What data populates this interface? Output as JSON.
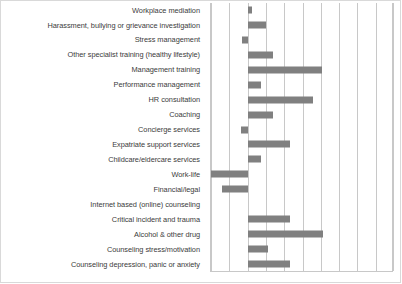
{
  "chart_data": {
    "type": "bar",
    "orientation": "horizontal",
    "title": "",
    "subtitle": "",
    "xlabel": "",
    "ylabel": "",
    "xlim": [
      -2,
      8
    ],
    "xticks": [
      -2,
      -1,
      0,
      1,
      2,
      3,
      4,
      5,
      6,
      7,
      8
    ],
    "xtick_labels": [
      "",
      "",
      "",
      "",
      "",
      "",
      "",
      "",
      "",
      "",
      ""
    ],
    "grid": true,
    "legend": false,
    "legend_position": "none",
    "bar_color": "#808080",
    "gridline_color": "#c8c8c8",
    "label_color": "#3b3b3b",
    "categories": [
      "Workplace mediation",
      "Harassment, bullying or grievance investigation",
      "Stress management",
      "Other specialist training (healthy lifestyle)",
      "Management training",
      "Performance management",
      "HR consultation",
      "Coaching",
      "Concierge services",
      "Expatriate support services",
      "Childcare/eldercare services",
      "Work-life",
      "Financial/legal",
      "Internet based (online) counseling",
      "Critical incident and trauma",
      "Alcohol & other drug",
      "Counseling stress/motivation",
      "Counseling depression, panic or anxiety"
    ],
    "values": [
      0.25,
      1.0,
      -0.3,
      1.4,
      4.05,
      0.75,
      3.55,
      1.4,
      -0.35,
      2.3,
      0.75,
      -2.0,
      -1.4,
      0.0,
      2.3,
      4.1,
      1.1,
      2.3
    ]
  }
}
